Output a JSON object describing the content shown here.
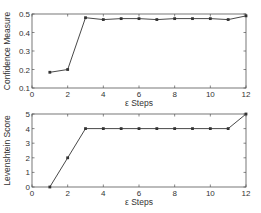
{
  "chart_data": [
    {
      "type": "line",
      "title": "",
      "xlabel": "ε Steps",
      "ylabel": "Confidence Measure",
      "x": [
        1,
        2,
        3,
        4,
        5,
        6,
        7,
        8,
        9,
        10,
        11,
        12
      ],
      "values": [
        0.185,
        0.2,
        0.48,
        0.47,
        0.475,
        0.475,
        0.47,
        0.475,
        0.475,
        0.475,
        0.47,
        0.49
      ],
      "xlim": [
        0,
        12
      ],
      "ylim": [
        0.1,
        0.5
      ],
      "xticks": [
        "0",
        "2",
        "4",
        "6",
        "8",
        "10",
        "12"
      ],
      "yticks": [
        "0.1",
        "0.2",
        "0.3",
        "0.4",
        "0.5"
      ],
      "grid": false,
      "legend": null
    },
    {
      "type": "line",
      "title": "",
      "xlabel": "ε Steps",
      "ylabel": "Levenshtein Score",
      "x": [
        1,
        2,
        3,
        4,
        5,
        6,
        7,
        8,
        9,
        10,
        11,
        12
      ],
      "values": [
        0,
        2,
        4,
        4,
        4,
        4,
        4,
        4,
        4,
        4,
        4,
        5
      ],
      "xlim": [
        0,
        12
      ],
      "ylim": [
        0,
        5
      ],
      "xticks": [
        "0",
        "2",
        "4",
        "6",
        "8",
        "10",
        "12"
      ],
      "yticks": [
        "0",
        "1",
        "2",
        "3",
        "4",
        "5"
      ],
      "grid": false,
      "legend": null
    }
  ],
  "colors": {
    "line": "#333333",
    "axis": "#555555"
  }
}
